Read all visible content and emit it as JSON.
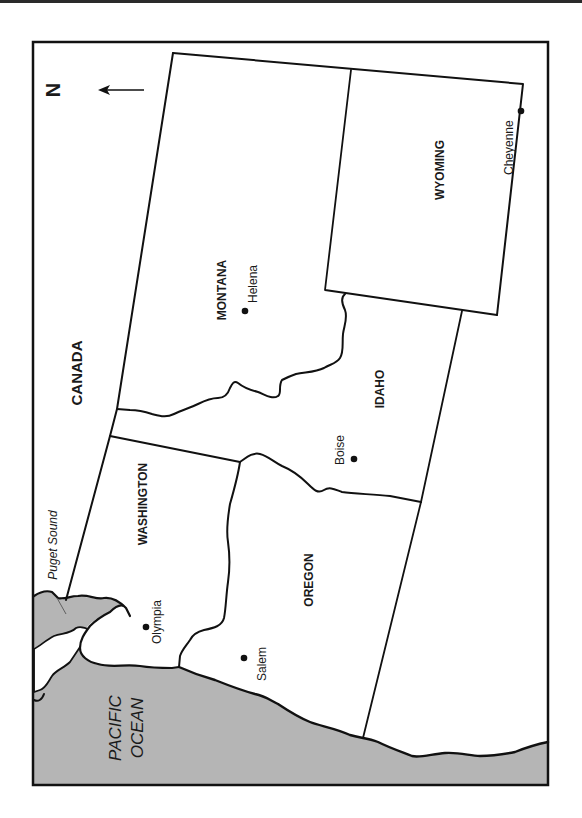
{
  "map": {
    "orientation": "rotated 90 degrees; north points left",
    "colors": {
      "water": "#b5b5b5",
      "land": "#ffffff",
      "lines": "#111111",
      "frame": "#111111"
    },
    "compass": {
      "letter": "N",
      "direction": "left"
    },
    "regions": {
      "canada": "CANADA",
      "montana": "MONTANA",
      "wyoming": "WYOMING",
      "idaho": "IDAHO",
      "washington": "WASHINGTON",
      "oregon": "OREGON"
    },
    "water_labels": {
      "puget_sound": "Puget Sound",
      "pacific_line1": "PACIFIC",
      "pacific_line2": "OCEAN"
    },
    "capitals": [
      {
        "name": "Helena",
        "state": "Montana"
      },
      {
        "name": "Cheyenne",
        "state": "Wyoming"
      },
      {
        "name": "Boise",
        "state": "Idaho"
      },
      {
        "name": "Olympia",
        "state": "Washington"
      },
      {
        "name": "Salem",
        "state": "Oregon"
      }
    ]
  }
}
